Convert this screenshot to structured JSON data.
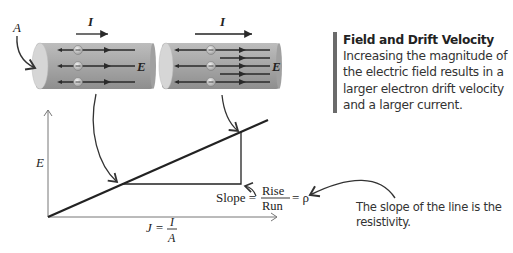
{
  "labels": {
    "area": "A",
    "current_left": "I",
    "current_right": "I",
    "field_left": "E",
    "field_right": "E",
    "y_axis": "E",
    "x_axis_lhs": "J =",
    "x_axis_num": "I",
    "x_axis_den": "A",
    "slope_label": "Slope =",
    "slope_num": "Rise",
    "slope_den": "Run",
    "slope_eq": "= ρ",
    "electron_sign": "−"
  },
  "callout": {
    "title": "Field and Drift Velocity",
    "body": "Increasing the magnitude of the electric field results in a larger electron drift velocity and a larger current."
  },
  "note": {
    "text": "The slope of the line is the resistivity."
  },
  "colors": {
    "cylinder": "#a9a9a9",
    "cylinder_end": "#d4d4d4",
    "line": "#2a2a2a",
    "axis": "#777777",
    "callout_bar": "#6b6b6b"
  }
}
